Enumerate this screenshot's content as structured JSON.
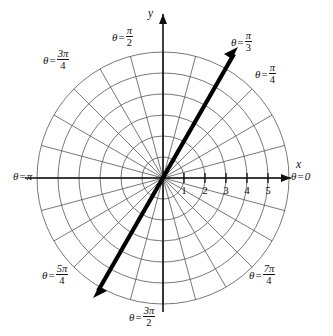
{
  "figure": {
    "type": "polar-coordinate-grid",
    "axes": {
      "x_label": "x",
      "y_label": "y"
    },
    "radial_ticks": [
      "1",
      "2",
      "3",
      "4",
      "5"
    ],
    "angle_labels": [
      {
        "id": "theta-0",
        "theta": "θ",
        "equals": "=",
        "value": "0",
        "kind": "plain"
      },
      {
        "id": "theta-pi-3",
        "theta": "θ",
        "equals": "=",
        "num": "π",
        "den": "3",
        "kind": "fraction"
      },
      {
        "id": "theta-pi-4",
        "theta": "θ",
        "equals": "=",
        "num": "π",
        "den": "4",
        "kind": "fraction"
      },
      {
        "id": "theta-pi-2",
        "theta": "θ",
        "equals": "=",
        "num": "π",
        "den": "2",
        "kind": "fraction"
      },
      {
        "id": "theta-3pi-4",
        "theta": "θ",
        "equals": "=",
        "num": "3π",
        "den": "4",
        "kind": "fraction"
      },
      {
        "id": "theta-pi",
        "theta": "θ",
        "equals": "=",
        "value": "π",
        "kind": "plain"
      },
      {
        "id": "theta-5pi-4",
        "theta": "θ",
        "equals": "=",
        "num": "5π",
        "den": "4",
        "kind": "fraction"
      },
      {
        "id": "theta-3pi-2",
        "theta": "θ",
        "equals": "=",
        "num": "3π",
        "den": "2",
        "kind": "fraction"
      },
      {
        "id": "theta-7pi-4",
        "theta": "θ",
        "equals": "=",
        "num": "7π",
        "den": "4",
        "kind": "fraction"
      }
    ]
  },
  "chart_data": {
    "type": "scatter",
    "title": "",
    "subtitle": "",
    "xlabel": "x",
    "ylabel": "y",
    "coordinate_system": "polar",
    "grid": true,
    "legend": "none",
    "xlim": [
      -6.6,
      6.6
    ],
    "ylim": [
      -6.6,
      6.6
    ],
    "radial_axis": {
      "label": "r",
      "range": [
        0,
        6
      ],
      "circle_radii": [
        1,
        2,
        3,
        4,
        5,
        6
      ],
      "tick_values": [
        1,
        2,
        3,
        4,
        5
      ],
      "tick_labels": [
        "1",
        "2",
        "3",
        "4",
        "5"
      ]
    },
    "angular_axis": {
      "label": "θ",
      "spoke_count": 24,
      "spoke_step_degrees": 15,
      "labeled_angles_degrees": [
        0,
        45,
        60,
        90,
        135,
        180,
        225,
        270,
        315
      ],
      "labeled_angles_text": [
        "θ = 0",
        "θ = π/4",
        "θ = π/3",
        "θ = π/2",
        "θ = 3π/4",
        "θ = π",
        "θ = 5π/4",
        "θ = 3π/2",
        "θ = 7π/4"
      ]
    },
    "series": [
      {
        "name": "theta = pi/3 line",
        "type": "line",
        "style": "thick double-headed arrow through origin",
        "angle_degrees": 60,
        "angle_radians": "π/3",
        "r_range": [
          -6.6,
          6.6
        ],
        "color": "#000000"
      }
    ],
    "annotations": [
      {
        "text": "θ = π/3",
        "angle_degrees": 60
      },
      {
        "text": "θ = π/4",
        "angle_degrees": 45
      },
      {
        "text": "θ = π/2",
        "angle_degrees": 90
      },
      {
        "text": "θ = 3π/4",
        "angle_degrees": 135
      },
      {
        "text": "θ = π",
        "angle_degrees": 180
      },
      {
        "text": "θ = 5π/4",
        "angle_degrees": 225
      },
      {
        "text": "θ = 3π/2",
        "angle_degrees": 270
      },
      {
        "text": "θ = 7π/4",
        "angle_degrees": 315
      },
      {
        "text": "θ = 0",
        "angle_degrees": 0
      }
    ]
  },
  "colors": {
    "grid": "#555555",
    "axis": "#111111",
    "ray": "#000000",
    "background": "#ffffff"
  }
}
